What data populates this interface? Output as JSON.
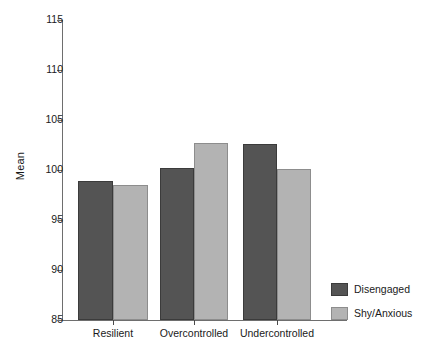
{
  "chart_data": {
    "type": "bar",
    "title": "",
    "xlabel": "",
    "ylabel": "Mean",
    "ylim": [
      85,
      115
    ],
    "ytick_step": 5,
    "yticks": [
      115,
      110,
      105,
      100,
      95,
      90,
      85
    ],
    "ytick_labels": [
      "115",
      "110",
      "105",
      "100",
      "95",
      "90",
      "85"
    ],
    "categories": [
      "Resilient",
      "Overcontrolled",
      "Undercontrolled"
    ],
    "grid": false,
    "legend_position": "right-bottom",
    "series": [
      {
        "name": "Disengaged",
        "color": "#545454",
        "values": [
          98.9,
          100.2,
          102.6
        ]
      },
      {
        "name": "Shy/Anxious",
        "color": "#b3b3b3",
        "values": [
          98.5,
          102.7,
          100.1
        ]
      }
    ]
  },
  "axis": {
    "y_title": "Mean"
  },
  "legend": {
    "items": [
      {
        "label": "Disengaged"
      },
      {
        "label": "Shy/Anxious"
      }
    ]
  }
}
